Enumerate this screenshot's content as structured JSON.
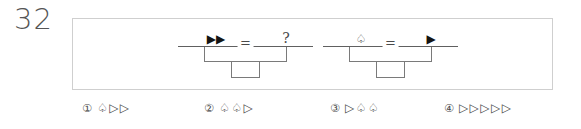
{
  "question": {
    "number": "32",
    "type": "balance-scale-logic-puzzle"
  },
  "stimulus": {
    "scales": [
      {
        "id": "scale-1",
        "left_side": {
          "symbols": "▶▶",
          "symbol_names": [
            "filled-right-triangle",
            "filled-right-triangle"
          ],
          "count": 2
        },
        "relation": "=",
        "right_side": {
          "symbols": "?",
          "symbol_names": [
            "question-mark"
          ],
          "count": 1
        }
      },
      {
        "id": "scale-2",
        "left_side": {
          "symbols": "♤",
          "symbol_names": [
            "open-spade"
          ],
          "count": 1
        },
        "relation": "=",
        "right_side": {
          "symbols": "▶",
          "symbol_names": [
            "filled-right-triangle"
          ],
          "count": 1
        }
      }
    ]
  },
  "options": [
    {
      "marker": "①",
      "marker_name": "circled-one",
      "symbols": "♤▷▷",
      "symbol_names": [
        "open-spade",
        "open-right-triangle",
        "open-right-triangle"
      ]
    },
    {
      "marker": "②",
      "marker_name": "circled-two",
      "symbols": "♤♤▷",
      "symbol_names": [
        "open-spade",
        "open-spade",
        "open-right-triangle"
      ]
    },
    {
      "marker": "③",
      "marker_name": "circled-three",
      "symbols": "▷♤♤",
      "symbol_names": [
        "open-right-triangle",
        "open-spade",
        "open-spade"
      ]
    },
    {
      "marker": "④",
      "marker_name": "circled-four",
      "symbols": "▷▷▷▷▷",
      "symbol_names": [
        "open-right-triangle",
        "open-right-triangle",
        "open-right-triangle",
        "open-right-triangle",
        "open-right-triangle"
      ]
    }
  ],
  "colors": {
    "page_background": "#ffffff",
    "frame_border": "#cfcfcf",
    "text": "#4a4a4a",
    "beam_line": "#606060",
    "scale_line": "#7a7a7a",
    "filled_glyph": "#141414"
  }
}
